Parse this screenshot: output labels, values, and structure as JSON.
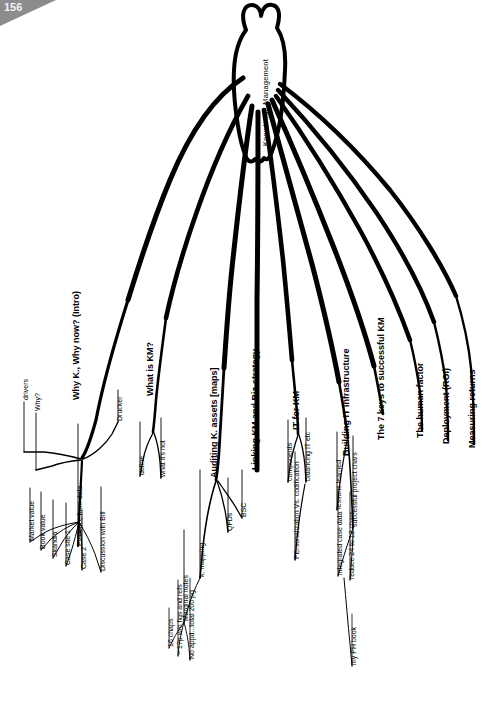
{
  "page": {
    "number": "156",
    "background_color": "#ffffff",
    "ink_color": "#000000",
    "corner_color": "#8c8c8c"
  },
  "mindmap": {
    "center": {
      "label": "Knowledge Management"
    },
    "branches": [
      {
        "id": "intro",
        "label": "Why K., Why now? (Intro)",
        "bold": true,
        "children": [
          {
            "label": "drivers"
          },
          {
            "label": "Why?"
          },
          {
            "label": "Evidence from data",
            "children": [
              {
                "label": "Market value"
              },
              {
                "label": "Book value"
              },
              {
                "label": "Skandia"
              },
              {
                "label": "Case site 1"
              },
              {
                "label": "Case 2"
              },
              {
                "label": "Discussion with Bill"
              }
            ]
          },
          {
            "label": "Drucker"
          }
        ]
      },
      {
        "id": "what-is-km",
        "label": "What is KM?",
        "bold": true,
        "children": [
          {
            "label": "define"
          },
          {
            "label": "what it's not"
          }
        ]
      },
      {
        "id": "auditing",
        "label": "Auditing K. assets [maps]",
        "bold": true,
        "children": [
          {
            "label": "k. mapping",
            "children": [
              {
                "label": "Marginal notes"
              }
            ]
          },
          {
            "label": "QFDs"
          },
          {
            "label": "BSC"
          }
        ]
      },
      {
        "id": "linking",
        "label": "Linking KM and Biz-strategy",
        "bold": true,
        "children": []
      },
      {
        "id": "it-for-km",
        "label": "IT for KM",
        "bold": true,
        "children": [
          {
            "label": "components"
          },
          {
            "label": "balancing IT etc"
          }
        ]
      },
      {
        "id": "building-it",
        "label": "Building IT infrastructure",
        "bold": true,
        "children": [
          {
            "label": "PErsonalization Vs. codification"
          }
        ]
      },
      {
        "id": "seven-keys",
        "label": "The 7 keys to successful KM",
        "bold": true,
        "children": [
          {
            "label": "lessons learned"
          },
          {
            "label": "successful project chars"
          }
        ]
      },
      {
        "id": "human-factor",
        "label": "The human factor",
        "bold": true,
        "children": []
      },
      {
        "id": "deployment",
        "label": "Deployment (ROI)",
        "bold": true,
        "children": []
      },
      {
        "id": "measuring",
        "label": "Measuring returns",
        "bold": true,
        "children": []
      }
    ],
    "notes": [
      {
        "id": "note-chaps",
        "label": "16 chaps"
      },
      {
        "id": "note-pages",
        "label": "~ 17p w/o figs and refs"
      },
      {
        "id": "note-total",
        "label": "No appd...total 200 pg"
      },
      {
        "id": "note-case-data",
        "label": "integrated case data"
      },
      {
        "id": "note-reduce",
        "label": "reduce 24 to 12 chars"
      },
      {
        "id": "note-ph-book",
        "label": "my PH book"
      }
    ]
  }
}
